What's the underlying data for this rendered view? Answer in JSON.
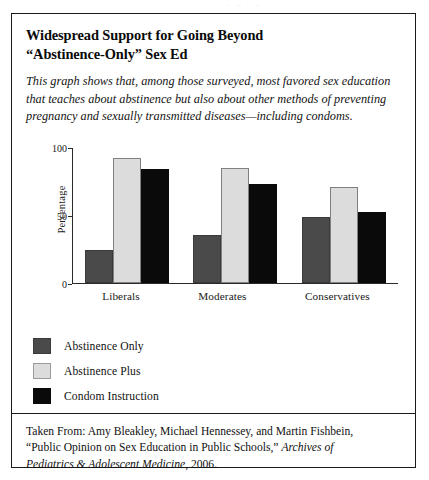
{
  "figure": {
    "title_lines": [
      "Widespread Support for Going Beyond",
      "“Abstinence-Only” Sex Ed"
    ],
    "description_lines": [
      "This graph shows that, among those surveyed, most favored sex education",
      "that teaches about abstinence but also about other methods of preventing",
      "pregnancy and sexually transmitted diseases—including condoms."
    ],
    "citation_lines": [
      "Taken From: Amy Bleakley, Michael Hennessey, and Martin Fishbein,",
      "“Public Opinion on Sex Education in Public Schools,” Archives of",
      "Pediatrics & Adolescent Medicine, 2006."
    ],
    "citation_italic_segments": [
      "Archives of",
      "Pediatrics & Adolescent Medicine"
    ]
  },
  "chart_data": {
    "type": "bar",
    "title": "Widespread Support for Going Beyond “Abstinence-Only” Sex Ed",
    "categories": [
      "Liberals",
      "Moderates",
      "Conservatives"
    ],
    "series": [
      {
        "name": "Abstinence Only",
        "color": "#4a4a4a",
        "values": [
          24,
          35,
          49
        ]
      },
      {
        "name": "Abstinence Plus",
        "color": "#dcdcdc",
        "values": [
          92,
          85,
          71
        ]
      },
      {
        "name": "Condom Instruction",
        "color": "#0a0a0a",
        "values": [
          84,
          73,
          52
        ]
      }
    ],
    "xlabel": "",
    "ylabel": "Percentage",
    "ylim": [
      0,
      100
    ],
    "yticks": [
      0,
      50,
      100
    ],
    "grid": false,
    "legend_position": "below-left"
  },
  "colors": {
    "series0": "#4a4a4a",
    "series1": "#dcdcdc",
    "series2": "#0a0a0a",
    "axis": "#2a2a2a",
    "border": "#1a1a1a"
  }
}
